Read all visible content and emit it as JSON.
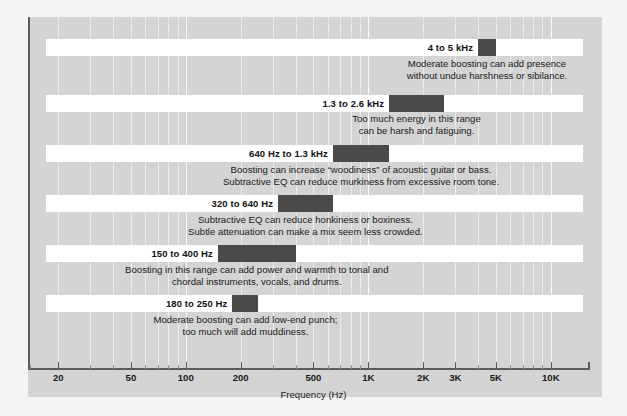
{
  "chart_data": {
    "type": "bar",
    "title": "",
    "xlabel": "Frequency (Hz)",
    "ylabel": "",
    "orientation": "horizontal",
    "xscale": "log",
    "xlim": [
      14,
      16000
    ],
    "grid": true,
    "legend": "none",
    "tick_labels": [
      "20",
      "50",
      "100",
      "200",
      "500",
      "1K",
      "2K",
      "3K",
      "5K",
      "10K"
    ],
    "tick_values": [
      20,
      50,
      100,
      200,
      500,
      1000,
      2000,
      3000,
      5000,
      10000
    ],
    "bands": [
      {
        "label": "4 to 5 kHz",
        "low_hz": 4000,
        "high_hz": 5000,
        "description_lines": [
          "Moderate boosting can add presence",
          "without undue harshness or sibilance."
        ]
      },
      {
        "label": "1.3 to 2.6 kHz",
        "low_hz": 1300,
        "high_hz": 2600,
        "description_lines": [
          "Too much energy in this range",
          "can be harsh and fatiguing."
        ]
      },
      {
        "label": "640 Hz to 1.3 kHz",
        "low_hz": 640,
        "high_hz": 1300,
        "description_lines": [
          "Boosting can increase “woodiness” of acoustic guitar or bass.",
          "Subtractive EQ can reduce murkiness from excessive room tone."
        ]
      },
      {
        "label": "320 to 640 Hz",
        "low_hz": 320,
        "high_hz": 640,
        "description_lines": [
          "Subtractive EQ can reduce honkiness or boxiness.",
          "Subtle attenuation can make a mix seem less crowded."
        ]
      },
      {
        "label": "150 to 400 Hz",
        "low_hz": 150,
        "high_hz": 400,
        "description_lines": [
          "Boosting in this range can add power and warmth to tonal and",
          "chordal instruments, vocals, and drums."
        ]
      },
      {
        "label": "180 to 250 Hz",
        "low_hz": 180,
        "high_hz": 250,
        "description_lines": [
          "Moderate boosting can add low-end punch;",
          "too much will add muddiness."
        ]
      }
    ]
  },
  "colors": {
    "panel_background": "#d4d4d4",
    "page_background": "#f4f4f2",
    "strip": "#ffffff",
    "bar": "#4a4a4a",
    "axis": "#5b5b5b",
    "text": "#1a1a1a"
  }
}
